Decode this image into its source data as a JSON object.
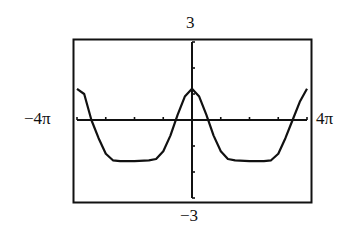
{
  "chart_data": {
    "type": "line",
    "title": "",
    "xlabel": "",
    "ylabel": "",
    "xlim": [
      "-4π",
      "4π"
    ],
    "ylim": [
      -3,
      3
    ],
    "x_range_labels": {
      "min": "−4π",
      "max": "4π"
    },
    "y_range_labels": {
      "min": "−3",
      "max": "3"
    },
    "x_ticks_step": "π",
    "y_ticks_step": 1,
    "grid": false,
    "legend": null,
    "series": [
      {
        "name": "f(x)",
        "x_in_pi": [
          -4,
          -3.75,
          -3.5,
          -3.25,
          -3,
          -2.75,
          -2.5,
          -2,
          -1.5,
          -1.25,
          -1,
          -0.75,
          -0.5,
          -0.25,
          0,
          0.25,
          0.5,
          0.75,
          1,
          1.25,
          1.5,
          2,
          2.5,
          2.75,
          3,
          3.25,
          3.5,
          3.75,
          4
        ],
        "y": [
          1.2,
          1.0,
          0.0,
          -0.7,
          -1.3,
          -1.55,
          -1.58,
          -1.58,
          -1.55,
          -1.5,
          -1.2,
          -0.6,
          0.2,
          0.9,
          1.2,
          0.9,
          0.2,
          -0.6,
          -1.2,
          -1.5,
          -1.55,
          -1.58,
          -1.58,
          -1.55,
          -1.3,
          -0.7,
          0.0,
          0.7,
          1.2
        ]
      }
    ]
  },
  "labels": {
    "top": "3",
    "bottom": "−3",
    "left": "−4π",
    "right": "4π"
  }
}
